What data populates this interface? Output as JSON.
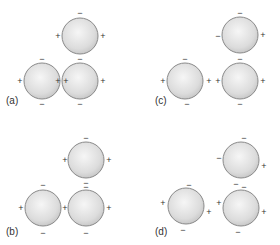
{
  "figure": {
    "colors": {
      "sphere_fill_center": "#f4f4f4",
      "sphere_fill_edge": "#c4c4c4",
      "sphere_stroke": "#8a8a8a",
      "text": "#333333"
    },
    "panels": [
      {
        "label": "(a)",
        "label_pos": [
          6,
          104
        ],
        "spheres": [
          {
            "cx": 80,
            "cy": 36,
            "r": 18,
            "signs": [
              {
                "t": "−",
                "x": 80,
                "y": 13
              },
              {
                "t": "+",
                "x": 58,
                "y": 36
              },
              {
                "t": "+",
                "x": 103,
                "y": 36
              }
            ]
          },
          {
            "cx": 42,
            "cy": 81,
            "r": 18,
            "signs": [
              {
                "t": "−",
                "x": 42,
                "y": 59
              },
              {
                "t": "+",
                "x": 20,
                "y": 81
              },
              {
                "t": "+",
                "x": 58,
                "y": 81
              },
              {
                "t": "−",
                "x": 42,
                "y": 104
              }
            ]
          },
          {
            "cx": 80,
            "cy": 81,
            "r": 18,
            "signs": [
              {
                "t": "−",
                "x": 80,
                "y": 59
              },
              {
                "t": "+",
                "x": 66,
                "y": 81
              },
              {
                "t": "+",
                "x": 103,
                "y": 81
              },
              {
                "t": "−",
                "x": 80,
                "y": 104
              }
            ]
          }
        ]
      },
      {
        "label": "(c)",
        "label_pos": [
          155,
          104
        ],
        "spheres": [
          {
            "cx": 240,
            "cy": 35,
            "r": 18,
            "signs": [
              {
                "t": "−",
                "x": 240,
                "y": 13
              },
              {
                "t": "−",
                "x": 218,
                "y": 36
              },
              {
                "t": "+",
                "x": 263,
                "y": 35
              }
            ]
          },
          {
            "cx": 185,
            "cy": 81,
            "r": 18,
            "signs": [
              {
                "t": "−",
                "x": 185,
                "y": 59
              },
              {
                "t": "+",
                "x": 163,
                "y": 81
              },
              {
                "t": "+",
                "x": 209,
                "y": 81
              },
              {
                "t": "−",
                "x": 187,
                "y": 104
              }
            ]
          },
          {
            "cx": 240,
            "cy": 81,
            "r": 18,
            "signs": [
              {
                "t": "−",
                "x": 240,
                "y": 59
              },
              {
                "t": "+",
                "x": 218,
                "y": 81
              },
              {
                "t": "+",
                "x": 263,
                "y": 81
              },
              {
                "t": "−",
                "x": 240,
                "y": 104
              }
            ]
          }
        ]
      },
      {
        "label": "(b)",
        "label_pos": [
          6,
          235
        ],
        "spheres": [
          {
            "cx": 86,
            "cy": 160,
            "r": 18,
            "signs": [
              {
                "t": "−",
                "x": 86,
                "y": 138
              },
              {
                "t": "+",
                "x": 65,
                "y": 160
              },
              {
                "t": "+",
                "x": 109,
                "y": 160
              }
            ]
          },
          {
            "cx": 43,
            "cy": 208,
            "r": 18,
            "signs": [
              {
                "t": "−",
                "x": 43,
                "y": 185
              },
              {
                "t": "+",
                "x": 21,
                "y": 208
              },
              {
                "t": "+",
                "x": 65,
                "y": 208
              },
              {
                "t": "−",
                "x": 43,
                "y": 233
              }
            ]
          },
          {
            "cx": 86,
            "cy": 208,
            "r": 18,
            "signs": [
              {
                "t": "−",
                "x": 86,
                "y": 183
              },
              {
                "t": "−",
                "x": 86,
                "y": 187
              },
              {
                "t": "+",
                "x": 109,
                "y": 208
              },
              {
                "t": "−",
                "x": 86,
                "y": 233
              }
            ]
          }
        ]
      },
      {
        "label": "(d)",
        "label_pos": [
          155,
          235
        ],
        "spheres": [
          {
            "cx": 241,
            "cy": 160,
            "r": 18,
            "signs": [
              {
                "t": "−",
                "x": 244,
                "y": 138
              },
              {
                "t": "−",
                "x": 219,
                "y": 158
              },
              {
                "t": "+",
                "x": 264,
                "y": 166
              }
            ]
          },
          {
            "cx": 186,
            "cy": 206,
            "r": 18,
            "signs": [
              {
                "t": "−",
                "x": 189,
                "y": 185
              },
              {
                "t": "+",
                "x": 163,
                "y": 203
              },
              {
                "t": "+",
                "x": 209,
                "y": 212
              },
              {
                "t": "−",
                "x": 183,
                "y": 230
              }
            ]
          },
          {
            "cx": 241,
            "cy": 208,
            "r": 18,
            "signs": [
              {
                "t": "−",
                "x": 236,
                "y": 184
              },
              {
                "t": "−",
                "x": 244,
                "y": 187
              },
              {
                "t": "+",
                "x": 219,
                "y": 203
              },
              {
                "t": "+",
                "x": 264,
                "y": 212
              },
              {
                "t": "−",
                "x": 238,
                "y": 232
              }
            ]
          }
        ]
      }
    ]
  }
}
